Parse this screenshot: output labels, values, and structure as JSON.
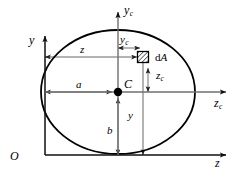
{
  "figure": {
    "type": "engineering-diagram",
    "width": 235,
    "height": 178,
    "background_color": "#ffffff",
    "stroke_color": "#000000",
    "dimension_line_color": "#808080",
    "shape": {
      "name": "ellipse",
      "center": {
        "x": 118,
        "y": 92
      },
      "semi_axis_horizontal": 77,
      "semi_axis_vertical": 62,
      "outline_width": 1.6
    },
    "origin": {
      "label": "O",
      "x": 45,
      "y": 155
    },
    "axes": [
      {
        "name": "outer-y-axis",
        "label": "y",
        "label_sub": "",
        "direction": "up",
        "x": 45,
        "from_y": 155,
        "to_y": 33
      },
      {
        "name": "outer-z-axis",
        "label": "z",
        "label_sub": "",
        "direction": "right",
        "y": 155,
        "from_x": 45,
        "to_x": 228
      },
      {
        "name": "centroidal-yc-axis",
        "label": "y",
        "label_sub": "c",
        "direction": "up",
        "x": 118,
        "from_y": 155,
        "to_y": 9
      },
      {
        "name": "centroidal-zc-axis",
        "label": "z",
        "label_sub": "c",
        "direction": "right",
        "y": 92,
        "from_x": 45,
        "to_x": 228
      }
    ],
    "centroid": {
      "label": "C",
      "x": 118,
      "y": 92,
      "dot_radius": 4
    },
    "area_element": {
      "label_prefix": "d",
      "label_symbol": "A",
      "x": 143,
      "y": 57,
      "size": 11,
      "hatched": true
    },
    "dimensions": [
      {
        "name": "semi-axis-a",
        "label": "a",
        "label_sub": "",
        "orientation": "horizontal",
        "from": {
          "x": 45,
          "y": 92
        },
        "to": {
          "x": 118,
          "y": 92
        },
        "label_x": 76,
        "label_y": 79
      },
      {
        "name": "semi-axis-b",
        "label": "b",
        "label_sub": "",
        "orientation": "vertical",
        "from": {
          "x": 118,
          "y": 155
        },
        "to": {
          "x": 118,
          "y": 92
        },
        "label_x": 107,
        "label_y": 125
      },
      {
        "name": "coordinate-z",
        "label": "z",
        "label_sub": "",
        "orientation": "horizontal",
        "from": {
          "x": 45,
          "y": 57
        },
        "to": {
          "x": 143,
          "y": 57
        },
        "label_x": 80,
        "label_y": 44
      },
      {
        "name": "coordinate-y",
        "label": "y",
        "label_sub": "",
        "orientation": "vertical",
        "from": {
          "x": 143,
          "y": 155
        },
        "to": {
          "x": 143,
          "y": 57
        },
        "label_x": 128,
        "label_y": 110
      },
      {
        "name": "coordinate-yc",
        "label": "y",
        "label_sub": "c",
        "orientation": "horizontal",
        "from": {
          "x": 118,
          "y": 48
        },
        "to": {
          "x": 143,
          "y": 48
        },
        "label_x": 120,
        "label_y": 35
      },
      {
        "name": "coordinate-zc",
        "label": "z",
        "label_sub": "c",
        "orientation": "vertical",
        "from": {
          "x": 143,
          "y": 92
        },
        "to": {
          "x": 143,
          "y": 62
        },
        "label_x": 154,
        "label_y": 70
      }
    ]
  }
}
